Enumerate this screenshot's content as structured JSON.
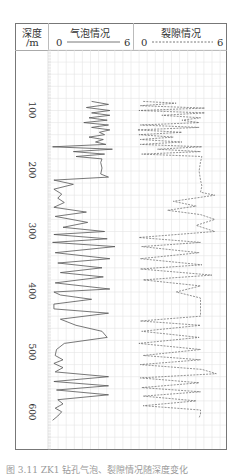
{
  "header": {
    "depth_label_line1": "深度",
    "depth_label_line2": "/m",
    "bubble_title": "气泡情况",
    "bubble_min": "0",
    "bubble_max": "6",
    "fracture_title": "裂隙情况",
    "fracture_min": "0",
    "fracture_max": "6"
  },
  "depth_ticks": [
    "100",
    "200",
    "300",
    "400",
    "500",
    "600"
  ],
  "caption": "图 3.11  ZK1 钻孔气泡、裂隙情况随深度变化",
  "chart_data": {
    "type": "line",
    "orientation": "vertical-depth",
    "title": "",
    "ylabel": "深度/m",
    "ylim": [
      0,
      640
    ],
    "y_inverted": true,
    "grid": true,
    "legend_position": "header",
    "series": [
      {
        "name": "气泡情况",
        "style": "solid",
        "xlim": [
          0,
          6
        ],
        "depth": [
          85,
          90,
          95,
          100,
          104,
          108,
          112,
          116,
          120,
          124,
          128,
          132,
          136,
          140,
          144,
          148,
          152,
          156,
          160,
          164,
          168,
          172,
          176,
          180,
          186,
          195,
          205,
          210,
          215,
          222,
          230,
          238,
          245,
          252,
          260,
          268,
          275,
          285,
          293,
          300,
          305,
          312,
          318,
          325,
          335,
          345,
          352,
          360,
          368,
          375,
          385,
          395,
          400,
          405,
          412,
          420,
          428,
          435,
          445,
          455,
          465,
          475,
          485,
          495,
          505,
          512,
          518,
          525,
          532,
          540,
          548,
          555,
          562,
          570,
          578,
          585,
          592,
          598,
          605,
          612
        ],
        "values": [
          3.2,
          4.5,
          2.8,
          4.6,
          3.2,
          4.6,
          3.0,
          4.4,
          2.6,
          4.5,
          3.2,
          4.6,
          3.8,
          4.2,
          3.0,
          4.1,
          3.5,
          4.3,
          0.2,
          4.8,
          1.8,
          4.2,
          2.0,
          4.0,
          3.9,
          4.0,
          3.9,
          4.5,
          0.3,
          1.8,
          0.3,
          0.9,
          0.6,
          1.1,
          0.3,
          2.8,
          0.4,
          2.9,
          1.0,
          4.2,
          0.3,
          4.4,
          0.2,
          5.0,
          0.4,
          4.6,
          0.6,
          4.0,
          0.8,
          4.1,
          0.4,
          4.6,
          0.3,
          0.8,
          3.2,
          0.3,
          0.3,
          4.5,
          0.8,
          2.0,
          4.0,
          4.4,
          1.1,
          0.5,
          0.4,
          1.0,
          0.3,
          1.0,
          0.4,
          4.5,
          0.3,
          4.5,
          0.5,
          4.5,
          0.6,
          1.0,
          0.4,
          0.9,
          0.6,
          0.2
        ]
      },
      {
        "name": "裂隙情况",
        "style": "dashed",
        "xlim": [
          0,
          6
        ],
        "depth": [
          85,
          88,
          92,
          96,
          100,
          104,
          108,
          112,
          116,
          120,
          124,
          128,
          132,
          136,
          140,
          144,
          148,
          152,
          156,
          160,
          164,
          168,
          172,
          176,
          185,
          200,
          215,
          225,
          235,
          240,
          250,
          258,
          265,
          272,
          280,
          290,
          300,
          310,
          318,
          325,
          335,
          345,
          355,
          362,
          372,
          380,
          390,
          400,
          410,
          420,
          430,
          440,
          448,
          455,
          465,
          475,
          485,
          495,
          505,
          512,
          520,
          528,
          535,
          542,
          550,
          558,
          565,
          572,
          580,
          588,
          595,
          602,
          608
        ],
        "values": [
          0.5,
          2.8,
          0.3,
          4.8,
          0.2,
          4.8,
          1.8,
          4.5,
          3.2,
          4.4,
          0.3,
          4.4,
          0.1,
          3.2,
          0.2,
          2.6,
          0.3,
          3.2,
          0.3,
          4.6,
          1.5,
          4.5,
          0.4,
          4.6,
          4.5,
          4.4,
          4.5,
          4.6,
          4.5,
          5.5,
          2.6,
          4.2,
          2.2,
          4.5,
          5.5,
          4.2,
          5.5,
          0.2,
          4.5,
          0.4,
          4.4,
          0.3,
          4.6,
          0.3,
          5.3,
          0.5,
          4.5,
          2.8,
          4.5,
          4.5,
          4.5,
          4.5,
          0.3,
          4.5,
          0.4,
          4.4,
          0.2,
          4.5,
          0.5,
          4.5,
          0.3,
          4.6,
          5.6,
          0.3,
          4.4,
          0.4,
          4.5,
          0.5,
          4.2,
          0.5,
          4.5,
          4.5,
          4.4
        ]
      }
    ]
  }
}
